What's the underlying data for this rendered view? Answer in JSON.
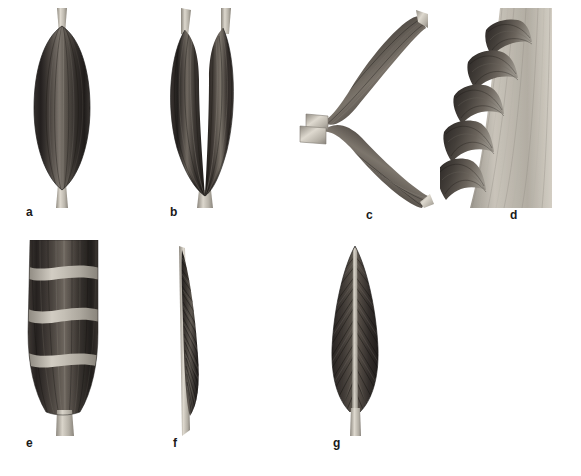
{
  "plate": {
    "title": "Muscle architecture types",
    "background_color": "#ffffff",
    "width": 581,
    "height": 476,
    "medium": "grayscale anatomical illustration",
    "label_color": "#1a1a1a"
  },
  "palette": {
    "muscle_dark": "#2f2d2c",
    "muscle_mid": "#58544f",
    "muscle_light": "#8d8882",
    "tendon_light": "#d6d2c9",
    "tendon_mid": "#b3aea4",
    "tendon_shadow": "#8e8a81",
    "outline": "#1c1b1a",
    "background": "#ffffff"
  },
  "figures": [
    {
      "key": "a",
      "label": "a",
      "name": "fusiform-muscle",
      "description": "Fusiform (spindle-shaped) muscle with a single belly and a tendon at each end",
      "icon": "fusiform-muscle-icon"
    },
    {
      "key": "b",
      "label": "b",
      "name": "bicipital-muscle",
      "description": "Two-headed (bicipital) muscle with two proximal tendons converging on one distal tendon",
      "icon": "bicipital-muscle-icon"
    },
    {
      "key": "c",
      "label": "c",
      "name": "digastric-muscle",
      "description": "Digastric muscle: two bellies joined at an angle by an intermediate tendon held in a fibrous loop",
      "icon": "digastric-muscle-icon"
    },
    {
      "key": "d",
      "label": "d",
      "name": "multi-digitation-muscle",
      "description": "Multi-headed muscle with five fleshy digitations inserting on a broad aponeurotic sheet",
      "icon": "digitated-muscle-icon"
    },
    {
      "key": "e",
      "label": "e",
      "name": "polygastric-muscle",
      "description": "Polygastric (multi-bellied) muscle subdivided by transverse tendinous intersections",
      "icon": "polygastric-muscle-icon"
    },
    {
      "key": "f",
      "label": "f",
      "name": "unipennate-muscle",
      "description": "Unipennate muscle: fibres attach obliquely to one side of a long tendon",
      "icon": "unipennate-muscle-icon"
    },
    {
      "key": "g",
      "label": "g",
      "name": "bipennate-muscle",
      "description": "Bipennate muscle: fibres attach obliquely to both sides of a central tendon",
      "icon": "bipennate-muscle-icon"
    }
  ],
  "labels": {
    "a": "a",
    "b": "b",
    "c": "c",
    "d": "d",
    "e": "e",
    "f": "f",
    "g": "g"
  }
}
